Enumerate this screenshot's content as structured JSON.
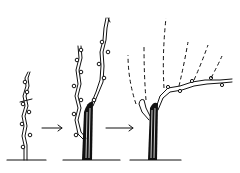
{
  "diagram": {
    "stages": [
      {
        "name": "stage-1",
        "label": "single young cane with buds"
      },
      {
        "name": "stage-2",
        "label": "trunk with two upright canes"
      },
      {
        "name": "stage-3",
        "label": "trained vine with horizontal cordon and dashed new shoots"
      }
    ],
    "arrows": 2,
    "colors": {
      "line": "#111111",
      "background": "#ffffff"
    }
  }
}
